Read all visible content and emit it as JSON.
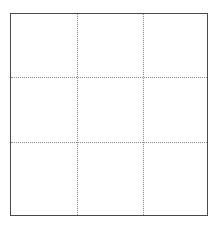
{
  "diagram": {
    "type": "grid",
    "rows": 3,
    "columns": 3,
    "frame_color": "#4a4a4a",
    "gridline_color": "#8a8a8a",
    "gridline_style": "dotted",
    "cells": [
      {
        "row": 0,
        "col": 0,
        "label": ""
      },
      {
        "row": 0,
        "col": 1,
        "label": ""
      },
      {
        "row": 0,
        "col": 2,
        "label": ""
      },
      {
        "row": 1,
        "col": 0,
        "label": ""
      },
      {
        "row": 1,
        "col": 1,
        "label": ""
      },
      {
        "row": 1,
        "col": 2,
        "label": ""
      },
      {
        "row": 2,
        "col": 0,
        "label": ""
      },
      {
        "row": 2,
        "col": 1,
        "label": ""
      },
      {
        "row": 2,
        "col": 2,
        "label": ""
      }
    ]
  }
}
